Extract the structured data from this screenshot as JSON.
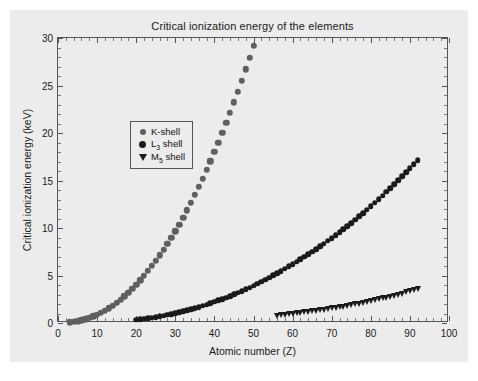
{
  "chart_data": {
    "type": "scatter",
    "title": "Critical ionization energy of the elements",
    "xlabel": "Atomic number (Z)",
    "ylabel": "Critical ionization energy (keV)",
    "xlim": [
      0,
      100
    ],
    "ylim": [
      0,
      30
    ],
    "xticks": [
      0,
      10,
      20,
      30,
      40,
      50,
      60,
      70,
      80,
      90,
      100
    ],
    "yticks": [
      0,
      5,
      10,
      15,
      20,
      25,
      30
    ],
    "xtick_labels": [
      "0",
      "10",
      "20",
      "30",
      "40",
      "50",
      "60",
      "70",
      "80",
      "90",
      "100"
    ],
    "ytick_labels": [
      "0",
      "5",
      "10",
      "15",
      "20",
      "25",
      "30"
    ],
    "grid": false,
    "legend_position": "upper left",
    "series": [
      {
        "name": "K-shell",
        "marker": "circle",
        "color": "#5f5f5f",
        "x": [
          3,
          4,
          5,
          6,
          7,
          8,
          9,
          10,
          11,
          12,
          13,
          14,
          15,
          16,
          17,
          18,
          19,
          20,
          21,
          22,
          23,
          24,
          25,
          26,
          27,
          28,
          29,
          30,
          31,
          32,
          33,
          34,
          35,
          36,
          37,
          38,
          39,
          40,
          41,
          42,
          43,
          44,
          45,
          46,
          47,
          48,
          49,
          50
        ],
        "y": [
          0.055,
          0.112,
          0.188,
          0.284,
          0.4,
          0.532,
          0.685,
          0.867,
          1.072,
          1.305,
          1.56,
          1.839,
          2.146,
          2.472,
          2.822,
          3.206,
          3.608,
          4.038,
          4.492,
          4.966,
          5.465,
          5.989,
          6.539,
          7.112,
          7.709,
          8.333,
          8.979,
          9.659,
          10.367,
          11.103,
          11.867,
          12.658,
          13.474,
          14.326,
          15.2,
          16.105,
          17.038,
          17.998,
          18.986,
          20.0,
          21.044,
          22.117,
          23.22,
          24.35,
          25.514,
          26.711,
          27.94,
          29.2
        ]
      },
      {
        "name": "L3 shell",
        "marker": "circle",
        "color": "#1a1a1a",
        "x": [
          20,
          21,
          22,
          23,
          24,
          25,
          26,
          27,
          28,
          29,
          30,
          31,
          32,
          33,
          34,
          35,
          36,
          37,
          38,
          39,
          40,
          41,
          42,
          43,
          44,
          45,
          46,
          47,
          48,
          49,
          50,
          51,
          52,
          53,
          54,
          55,
          56,
          57,
          58,
          59,
          60,
          61,
          62,
          63,
          64,
          65,
          66,
          67,
          68,
          69,
          70,
          71,
          72,
          73,
          74,
          75,
          76,
          77,
          78,
          79,
          80,
          81,
          82,
          83,
          84,
          85,
          86,
          87,
          88,
          89,
          90,
          91,
          92
        ],
        "y": [
          0.346,
          0.399,
          0.454,
          0.512,
          0.574,
          0.639,
          0.708,
          0.779,
          0.853,
          0.932,
          1.021,
          1.116,
          1.217,
          1.323,
          1.434,
          1.552,
          1.675,
          1.804,
          1.94,
          2.08,
          2.222,
          2.371,
          2.52,
          2.677,
          2.838,
          3.004,
          3.173,
          3.351,
          3.538,
          3.73,
          3.928,
          4.132,
          4.341,
          4.557,
          4.782,
          5.012,
          5.247,
          5.483,
          5.723,
          5.964,
          6.208,
          6.459,
          6.716,
          6.977,
          7.243,
          7.514,
          7.79,
          8.071,
          8.358,
          8.648,
          8.944,
          9.244,
          9.561,
          9.881,
          10.205,
          10.535,
          10.871,
          11.215,
          11.564,
          11.919,
          12.284,
          12.658,
          13.035,
          13.419,
          13.814,
          14.214,
          14.619,
          15.031,
          15.444,
          15.871,
          16.3,
          16.733,
          17.166
        ]
      },
      {
        "name": "M5 shell",
        "marker": "triangle-down",
        "color": "#1a1a1a",
        "x": [
          56,
          57,
          58,
          59,
          60,
          61,
          62,
          63,
          64,
          65,
          66,
          67,
          68,
          69,
          70,
          71,
          72,
          73,
          74,
          75,
          76,
          77,
          78,
          79,
          80,
          81,
          82,
          83,
          84,
          85,
          86,
          87,
          88,
          89,
          90,
          91,
          92
        ],
        "y": [
          0.781,
          0.833,
          0.883,
          0.978,
          1.0,
          1.027,
          1.081,
          1.131,
          1.185,
          1.241,
          1.292,
          1.351,
          1.409,
          1.468,
          1.528,
          1.589,
          1.662,
          1.735,
          1.809,
          1.883,
          1.96,
          2.04,
          2.122,
          2.206,
          2.295,
          2.389,
          2.484,
          2.58,
          2.683,
          2.787,
          2.892,
          3.0,
          3.105,
          3.219,
          3.332,
          3.442,
          3.552
        ]
      }
    ]
  },
  "legend": {
    "items": [
      {
        "label_main": "K-shell",
        "sub": "",
        "label_tail": ""
      },
      {
        "label_main": "L",
        "sub": "3",
        "label_tail": " shell"
      },
      {
        "label_main": "M",
        "sub": "5",
        "label_tail": " shell"
      }
    ]
  },
  "colors": {
    "figure_background": "#ececec",
    "page_background": "#ffffff",
    "axis": "#555555",
    "k_shell": "#5f5f5f",
    "l3_shell": "#1a1a1a",
    "m5_shell": "#1a1a1a",
    "text": "#1a1a1a"
  }
}
